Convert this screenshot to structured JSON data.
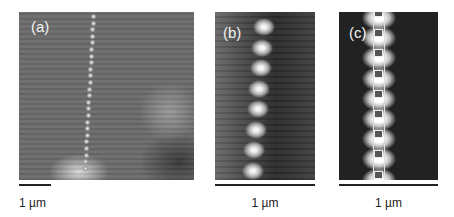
{
  "figure": {
    "panels": [
      {
        "label": "(a)",
        "scale_bar_text": "1 µm"
      },
      {
        "label": "(b)",
        "scale_bar_text": "1 µm"
      },
      {
        "label": "(c)",
        "scale_bar_text": "1 µm"
      }
    ]
  }
}
